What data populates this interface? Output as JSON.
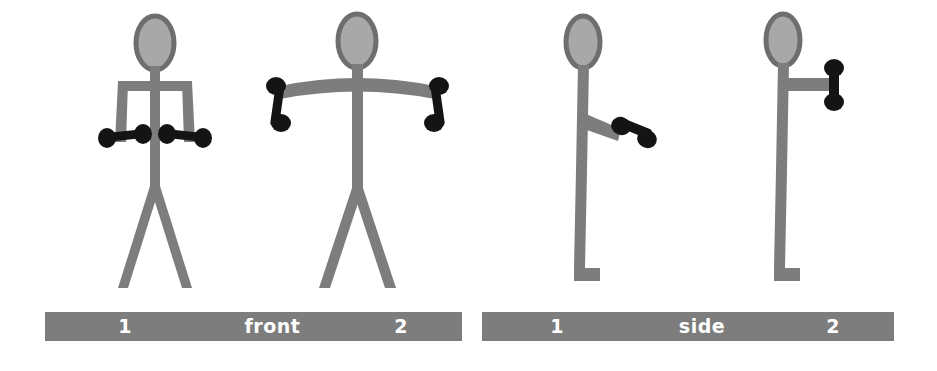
{
  "diagram": {
    "colors": {
      "limb_gray": "#7d7d7d",
      "head_fill": "#a8a8a8",
      "head_outline": "#6e6e6e",
      "dumbbell_black": "#141414",
      "bar_gray": "#7d7d7d",
      "bar_text": "#ffffff",
      "background": "#ffffff"
    },
    "views": [
      {
        "name": "front",
        "label": "front",
        "bar_left_number": "1",
        "bar_right_number": "2",
        "figures": [
          {
            "id": "front-1",
            "position_number": "1",
            "description": "Stick figure standing facing forward, arms hanging straight down at the sides, holding a dumbbell in each hand at hip level, legs apart in a V stance.",
            "arms": "down-at-sides",
            "dumbbells": 2,
            "dumbbell_orientation": "horizontal"
          },
          {
            "id": "front-2",
            "position_number": "2",
            "description": "Stick figure standing facing forward, arms raised out to both sides near shoulder height in a gentle arc, holding a dumbbell in each hand, legs apart in a V stance.",
            "arms": "raised-lateral",
            "dumbbells": 2,
            "dumbbell_orientation": "vertical"
          }
        ]
      },
      {
        "name": "side",
        "label": "side",
        "bar_left_number": "1",
        "bar_right_number": "2",
        "figures": [
          {
            "id": "side-1",
            "position_number": "1",
            "description": "Stick figure seen from the side, standing upright, one arm angled forward and slightly downward at hip level holding a dumbbell, foot pointing forward.",
            "arms": "forward-low",
            "dumbbells": 1,
            "dumbbell_orientation": "angled"
          },
          {
            "id": "side-2",
            "position_number": "2",
            "description": "Stick figure seen from the side, standing upright, one arm extended horizontally forward at shoulder height holding a dumbbell, foot pointing forward.",
            "arms": "forward-shoulder-height",
            "dumbbells": 1,
            "dumbbell_orientation": "vertical"
          }
        ]
      }
    ]
  }
}
